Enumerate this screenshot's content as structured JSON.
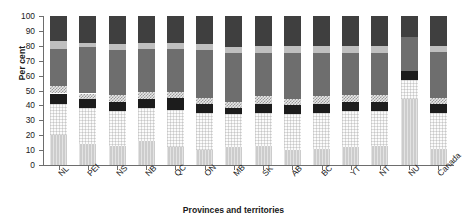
{
  "chart_data": {
    "type": "bar",
    "subtype": "stacked-bar-100",
    "title": "",
    "xlabel": "Provinces and territories",
    "ylabel": "Per cent",
    "ylim": [
      0,
      100
    ],
    "ytick_values": [
      0,
      10,
      20,
      30,
      40,
      50,
      60,
      70,
      80,
      90,
      100
    ],
    "ytick_labels": [
      "0",
      "10",
      "20",
      "30",
      "40",
      "50",
      "60",
      "70",
      "80",
      "90",
      "100"
    ],
    "grid": false,
    "legend": "none",
    "categories": [
      "NL",
      "PEI",
      "NS",
      "NB",
      "QC",
      "ON",
      "MB",
      "SK",
      "AB",
      "BC",
      "YT",
      "NT",
      "NU",
      "Canada"
    ],
    "series": [
      {
        "name": "segment-1",
        "style": "light-gray-striped",
        "color": "#cccccc",
        "values": [
          20,
          14,
          13,
          16,
          12,
          10,
          12,
          13,
          10,
          11,
          12,
          13,
          44,
          11
        ]
      },
      {
        "name": "segment-2",
        "style": "near-white-grid",
        "color": "#fbfbfb",
        "values": [
          21,
          24,
          23,
          22,
          25,
          25,
          22,
          22,
          24,
          24,
          24,
          23,
          13,
          24
        ]
      },
      {
        "name": "segment-3",
        "style": "black",
        "color": "#1c1c1c",
        "values": [
          7,
          6,
          6,
          6,
          8,
          6,
          4,
          6,
          6,
          6,
          6,
          6,
          6,
          6
        ]
      },
      {
        "name": "segment-4",
        "style": "checkerboard",
        "color": "#d2d2d2",
        "values": [
          5,
          4,
          5,
          5,
          4,
          4,
          4,
          5,
          4,
          5,
          5,
          5,
          0,
          4
        ]
      },
      {
        "name": "segment-5",
        "style": "dark-gray",
        "color": "#6e6e6e",
        "values": [
          25,
          31,
          30,
          29,
          29,
          32,
          33,
          29,
          31,
          29,
          28,
          28,
          23,
          31
        ]
      },
      {
        "name": "segment-6",
        "style": "pale-band",
        "color": "#bfbfbf",
        "values": [
          5,
          3,
          4,
          4,
          4,
          4,
          4,
          5,
          5,
          5,
          5,
          5,
          0,
          4
        ]
      },
      {
        "name": "segment-7",
        "style": "darkest-gray",
        "color": "#3f3f3f",
        "values": [
          17,
          18,
          19,
          18,
          18,
          19,
          21,
          20,
          20,
          20,
          20,
          20,
          14,
          20
        ]
      }
    ]
  }
}
